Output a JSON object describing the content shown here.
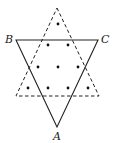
{
  "diagram": {
    "colors": {
      "stroke": "#222222",
      "dot": "#111111",
      "background": "#ffffff"
    },
    "solid_triangle": {
      "vertices": {
        "B": [
          16,
          40
        ],
        "C": [
          98,
          40
        ],
        "A": [
          57,
          127
        ]
      }
    },
    "dashed_triangle": {
      "vertices": {
        "top": [
          57,
          8
        ],
        "left": [
          16,
          96
        ],
        "right": [
          99,
          96
        ]
      }
    },
    "labels": [
      {
        "text": "B",
        "x": 5,
        "y": 43
      },
      {
        "text": "C",
        "x": 101,
        "y": 43
      },
      {
        "text": "A",
        "x": 53,
        "y": 140
      }
    ],
    "dots": [
      [
        58,
        24
      ],
      [
        48,
        45
      ],
      [
        68,
        45
      ],
      [
        38,
        67
      ],
      [
        58,
        67
      ],
      [
        78,
        67
      ],
      [
        28,
        88
      ],
      [
        48,
        88
      ],
      [
        68,
        88
      ],
      [
        88,
        88
      ]
    ]
  }
}
